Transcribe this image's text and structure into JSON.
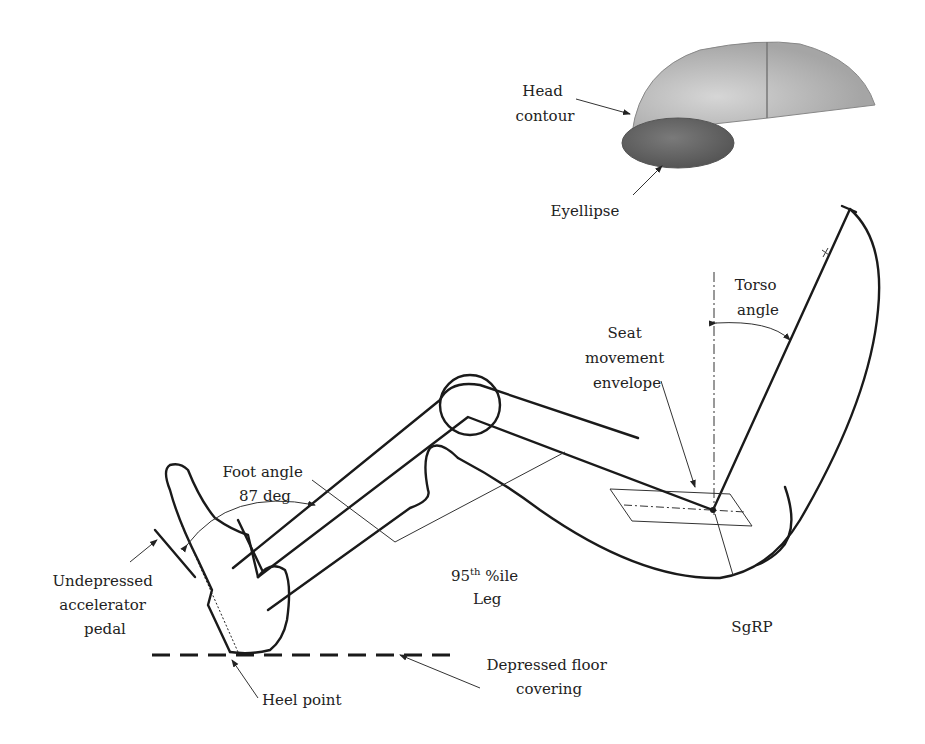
{
  "figure": {
    "labels": {
      "head_contour": [
        "Head",
        "contour"
      ],
      "eyellipse": "Eyellipse",
      "torso_angle": [
        "Torso",
        "angle"
      ],
      "seat_envelope": [
        "Seat",
        "movement",
        "envelope"
      ],
      "foot_angle": [
        "Foot angle",
        "87 deg"
      ],
      "leg": [
        "95",
        "th",
        " %ile",
        "Leg"
      ],
      "accelerator": [
        "Undepressed",
        "accelerator",
        "pedal"
      ],
      "sgrp": "SgRP",
      "heel_point": "Heel point",
      "floor": [
        "Depressed floor",
        "covering"
      ]
    },
    "colors": {
      "line": "#1a1a1a",
      "head_fill": "#a9a9a9",
      "eyellipse_fill": "#5f5f5f"
    }
  }
}
